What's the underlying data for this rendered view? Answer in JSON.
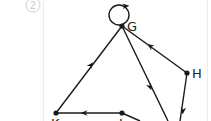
{
  "figure": {
    "number_label": "2",
    "nodes": [
      {
        "id": "G",
        "label": "G"
      },
      {
        "id": "H",
        "label": "H"
      },
      {
        "id": "K",
        "label": "K"
      },
      {
        "id": "J",
        "label": "J"
      }
    ],
    "edges": [
      {
        "from": "G",
        "to": "G",
        "type": "self-loop"
      },
      {
        "from": "H",
        "to": "G"
      },
      {
        "from": "K",
        "to": "G"
      },
      {
        "from": "J",
        "to": "K"
      },
      {
        "from": "G",
        "to": "off-bottom"
      },
      {
        "from": "H",
        "to": "off-bottom"
      },
      {
        "from": "J",
        "to": "off-bottom"
      }
    ],
    "colors": {
      "stroke": "#1a1a1a",
      "circle_label": "#c8c8c8"
    }
  }
}
